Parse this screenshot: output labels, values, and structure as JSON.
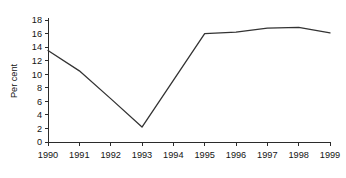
{
  "chart_data": {
    "type": "line",
    "title": "",
    "subtitle": "",
    "xlabel": "",
    "ylabel": "Per cent",
    "categories": [
      "1990",
      "1991",
      "1992",
      "1993",
      "1994",
      "1995",
      "1996",
      "1997",
      "1998",
      "1999"
    ],
    "x": [
      1990,
      1991,
      1992,
      1993,
      1994,
      1995,
      1996,
      1997,
      1998,
      1999
    ],
    "values": [
      13.5,
      10.5,
      6.4,
      2.2,
      9.1,
      16.0,
      16.2,
      16.8,
      16.9,
      16.1
    ],
    "series": [
      {
        "name": "Per cent",
        "values": [
          13.5,
          10.5,
          6.4,
          2.2,
          9.1,
          16.0,
          16.2,
          16.8,
          16.9,
          16.1
        ],
        "color": "#333333"
      }
    ],
    "ylim": [
      0,
      18
    ],
    "yticks": [
      0,
      2,
      4,
      6,
      8,
      10,
      12,
      14,
      16,
      18
    ],
    "ytick_labels": [
      "0",
      "2",
      "4",
      "6",
      "8",
      "10",
      "12",
      "14",
      "16",
      "18"
    ],
    "xtick_labels": [
      "1990",
      "1991",
      "1992",
      "1993",
      "1994",
      "1995",
      "1996",
      "1997",
      "1998",
      "1999"
    ],
    "grid": false,
    "legend": false,
    "legend_position": "none",
    "annotations": [],
    "line_color": "#333333",
    "axis_color": "#2b2b2b",
    "background_color": "#ffffff"
  }
}
